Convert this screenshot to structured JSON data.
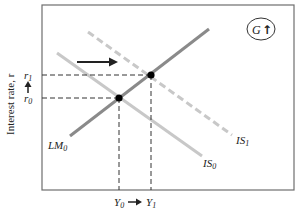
{
  "diagram": {
    "y_axis_label": "Interest rate, r",
    "y_ticks": [
      {
        "main": "r",
        "sub": "1"
      },
      {
        "main": "r",
        "sub": "0"
      }
    ],
    "x_ticks": [
      {
        "main": "Y",
        "sub": "0"
      },
      {
        "main": "Y",
        "sub": "1"
      }
    ],
    "curves": [
      {
        "id": "LM0",
        "main": "LM",
        "sub": "0",
        "style": "solid",
        "color": "#8a8a8a"
      },
      {
        "id": "IS0",
        "main": "IS",
        "sub": "0",
        "style": "solid",
        "color": "#c8c8c8"
      },
      {
        "id": "IS1",
        "main": "IS",
        "sub": "1",
        "style": "dashed",
        "color": "#c8c8c8"
      }
    ],
    "shift_arrow": "rightward shift of IS curve",
    "badge": {
      "label": "G",
      "arrow": "↑"
    },
    "colors": {
      "frame": "#6e6e6e",
      "lm": "#8a8a8a",
      "is": "#c8c8c8",
      "guide": "#333333",
      "point": "#000000"
    }
  }
}
